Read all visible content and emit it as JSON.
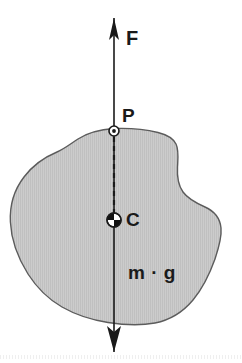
{
  "figure": {
    "type": "physics-free-body-diagram",
    "width": 242,
    "height": 363,
    "background_color": "#ffffff"
  },
  "labels": {
    "force": "F",
    "point": "P",
    "centre": "C",
    "weight": "m · g"
  },
  "body": {
    "name": "irregular-rigid-body",
    "fill_color": "#c9c9c9",
    "hatch_color": "#bdbdbd",
    "stroke_color": "#5c5c5c",
    "stroke_width": 1.4,
    "bounds": {
      "x_min": 10,
      "x_max": 222,
      "y_min": 127,
      "y_max": 326
    },
    "path": "M 114.0 128.5 C 100.0 129.5 88.0 132.5 78.0 139.0 C 70.0 144.2 64.0 149.0 57.0 152.0 C 45.0 157.0 33.0 165.0 24.0 177.0 C 14.0 190.0 9.6 206.0 10.4 222.0 C 11.2 240.0 18.0 258.0 28.0 274.0 C 37.0 288.0 48.0 299.0 62.0 307.0 C 76.0 315.0 92.0 320.0 108.0 322.5 C 124.0 325.0 140.0 325.8 155.0 323.0 C 170.0 320.0 183.0 312.0 193.0 300.0 C 203.0 288.0 210.0 273.0 215.0 259.0 C 219.0 247.0 221.8 236.0 221.0 228.0 C 220.0 218.0 214.0 211.0 205.0 207.0 C 196.0 203.0 188.0 199.0 183.0 192.0 C 178.0 185.0 177.0 176.0 177.5 167.0 C 178.0 158.0 179.0 150.0 176.0 144.0 C 173.0 138.0 166.0 134.5 158.0 132.5 C 147.0 129.8 130.0 127.8 114.0 128.5 Z"
  },
  "force_line": {
    "name": "line-of-action",
    "x": 114,
    "top_y": 18,
    "bottom_y": 352,
    "stroke_color": "#1a1a1a",
    "stroke_width": 1.6
  },
  "arrows": {
    "top": {
      "name": "force-arrow-up",
      "direction": "up",
      "tip_y": 18,
      "base_y": 40,
      "half_width": 5,
      "color": "#1a1a1a"
    },
    "bottom": {
      "name": "weight-arrow-down",
      "direction": "down",
      "tip_y": 352,
      "base_y": 326,
      "half_width": 7,
      "color": "#1a1a1a"
    }
  },
  "markers": {
    "point_p": {
      "name": "point-p-marker",
      "cx": 114,
      "cy": 131,
      "radius": 5,
      "style": "circle-with-centre-dot",
      "stroke_color": "#1a1a1a",
      "fill_color": "#ffffff"
    },
    "centre_c": {
      "name": "centre-of-mass-marker",
      "cx": 114,
      "cy": 220,
      "radius": 7,
      "style": "quartered-circle",
      "stroke_color": "#1a1a1a",
      "fill_color": "#ffffff",
      "quadrant_fill": "#111111"
    }
  },
  "dashed_segment": {
    "name": "p-to-c-dashed-line",
    "x": 114,
    "start_y": 137,
    "end_y": 213,
    "dash": "5 4",
    "stroke_color": "#1a1a1a",
    "stroke_width": 2.2
  }
}
